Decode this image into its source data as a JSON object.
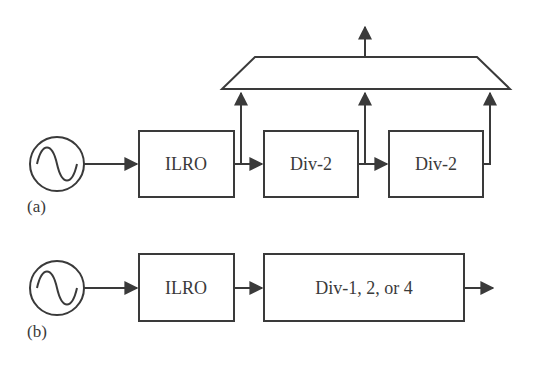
{
  "diagram": {
    "part_a": {
      "caption": "(a)",
      "source": "sine-source-icon",
      "blocks": [
        {
          "label": "ILRO"
        },
        {
          "label": "Div-2"
        },
        {
          "label": "Div-2"
        }
      ],
      "combiner": "multiplexer-trapezoid",
      "output": "output-arrow"
    },
    "part_b": {
      "caption": "(b)",
      "source": "sine-source-icon",
      "blocks": [
        {
          "label": "ILRO"
        },
        {
          "label": "Div-1, 2, or 4"
        }
      ],
      "output": "output-arrow"
    },
    "colors": {
      "stroke": "#3a3a3a",
      "background": "#ffffff"
    }
  }
}
